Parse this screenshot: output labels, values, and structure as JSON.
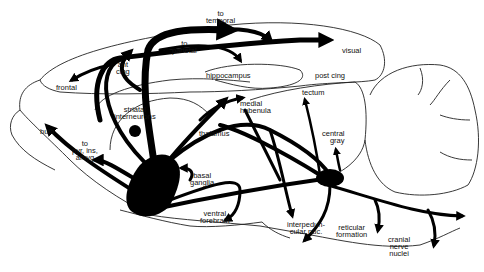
{
  "diagram": {
    "title": "",
    "labels": {
      "to_parietal": [
        "to",
        "parietal"
      ],
      "to_temporal": [
        "to",
        "temporal"
      ],
      "visual": "visual",
      "ant_cing": [
        "ant",
        "cing"
      ],
      "frontal": "frontal",
      "hippocampus": "hippocampus",
      "post_cing": "post cing",
      "tectum": "tectum",
      "medial_habenula": [
        "medial",
        "habenula"
      ],
      "striatal_interneurons": [
        "striatal",
        "interneurons"
      ],
      "thalamus": "thalamus",
      "central_gray": [
        "central",
        "gray"
      ],
      "bulb": "bulb",
      "to_pyr_ins_amyg": [
        "to",
        "pyr, ins,",
        "amyg"
      ],
      "basal_ganglia": [
        "basal",
        "ganglia"
      ],
      "ventral_forebrain": [
        "ventral",
        "forebrain"
      ],
      "interpeduncular_nuc": [
        "interpedun-",
        "cular nuc."
      ],
      "reticular_formation": [
        "reticular",
        "formation"
      ],
      "cranial_nerve_nuclei": [
        "cranial",
        "nerve",
        "nuclei"
      ]
    },
    "colors": {
      "background": "#ffffff",
      "ink": "#000000"
    }
  }
}
